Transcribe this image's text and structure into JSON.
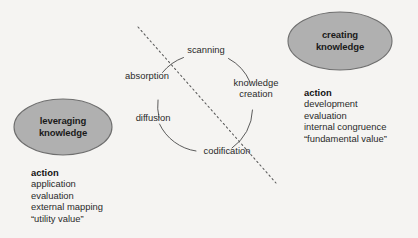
{
  "diagram": {
    "title_text": "",
    "background_color": "#f5f4f2",
    "node_fill_color": "#b0b0b0",
    "node_stroke_color": "#6e6e6e",
    "line_color": "#4a4a4a",
    "dashed_line_color": "#5a5a5a",
    "nodes": [
      {
        "id": "leveraging-knowledge",
        "label_line1": "leveraging",
        "label_line2": "knowledge",
        "action_heading": "action",
        "action_items": [
          "application",
          "evaluation",
          "external mapping",
          "“utility value”"
        ]
      },
      {
        "id": "creating-knowledge",
        "label_line1": "creating",
        "label_line2": "knowledge",
        "action_heading": "action",
        "action_items": [
          "development",
          "evaluation",
          "internal congruence",
          "“fundamental value”"
        ]
      }
    ],
    "cycle": {
      "labels": [
        {
          "id": "scanning",
          "line1": "scanning",
          "line2": ""
        },
        {
          "id": "knowledge-creation",
          "line1": "knowledge",
          "line2": "creation"
        },
        {
          "id": "codification",
          "line1": "codification",
          "line2": ""
        },
        {
          "id": "diffusion",
          "line1": "diffusion",
          "line2": ""
        },
        {
          "id": "absorption",
          "line1": "absorption",
          "line2": ""
        }
      ]
    }
  }
}
